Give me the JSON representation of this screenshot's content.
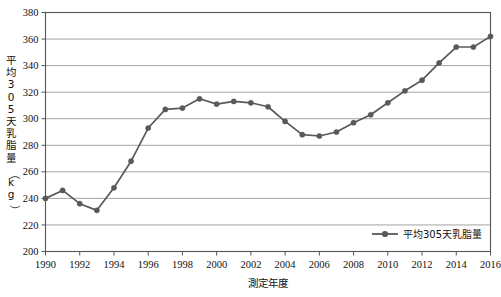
{
  "chart_data": {
    "type": "line",
    "title": "",
    "xlabel": "測定年度",
    "ylabel": "平均305天乳脂量（kg）",
    "ylim": [
      200,
      380
    ],
    "ytick_step": 20,
    "yticks": [
      200,
      220,
      240,
      260,
      280,
      300,
      320,
      340,
      360,
      380
    ],
    "xlim": [
      1990,
      2016
    ],
    "xticks": [
      1990,
      1992,
      1994,
      1996,
      1998,
      2000,
      2002,
      2004,
      2006,
      2008,
      2010,
      2012,
      2014,
      2016
    ],
    "grid": "horizontal",
    "legend_position": "bottom-right",
    "x": [
      1990,
      1991,
      1992,
      1993,
      1994,
      1995,
      1996,
      1997,
      1998,
      1999,
      2000,
      2001,
      2002,
      2003,
      2004,
      2005,
      2006,
      2007,
      2008,
      2009,
      2010,
      2011,
      2012,
      2013,
      2014,
      2015,
      2016
    ],
    "series": [
      {
        "name": "平均305天乳脂量",
        "color": "#595959",
        "marker": "circle",
        "values": [
          240,
          246,
          236,
          231,
          248,
          268,
          293,
          307,
          308,
          315,
          311,
          313,
          312,
          309,
          298,
          288,
          287,
          290,
          297,
          303,
          312,
          321,
          329,
          342,
          354,
          354,
          362
        ]
      }
    ]
  },
  "axes": {
    "y_tick_labels": [
      "380",
      "360",
      "340",
      "320",
      "300",
      "280",
      "260",
      "240",
      "220",
      "200"
    ],
    "x_tick_labels": [
      "1990",
      "1992",
      "1994",
      "1996",
      "1998",
      "2000",
      "2002",
      "2004",
      "2006",
      "2008",
      "2010",
      "2012",
      "2014",
      "2016"
    ],
    "y_axis_title_chars": [
      "平",
      "均",
      "3",
      "0",
      "5",
      "天",
      "乳",
      "脂",
      "量",
      "（",
      "k",
      "g",
      "）"
    ],
    "y_axis_title": "平均305天乳脂量（kg）",
    "x_axis_title": "測定年度"
  },
  "legend": {
    "entries": [
      {
        "label": "平均305天乳脂量",
        "color": "#595959"
      }
    ]
  },
  "style": {
    "line_color": "#595959",
    "marker_color": "#595959",
    "grid_color": "#8c8c8c",
    "frame_color": "#555555",
    "background": "#ffffff"
  }
}
